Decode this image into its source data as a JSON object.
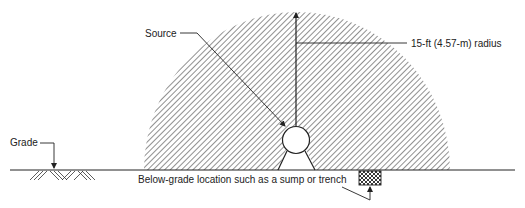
{
  "diagram": {
    "type": "hazardous-area-classification",
    "labels": {
      "source": "Source",
      "radius": "15-ft (4.57-m) radius",
      "grade": "Grade",
      "below_grade": "Below-grade location such as a sump or trench"
    },
    "colors": {
      "line": "#222222",
      "hatch": "#333333",
      "background": "#ffffff"
    }
  }
}
